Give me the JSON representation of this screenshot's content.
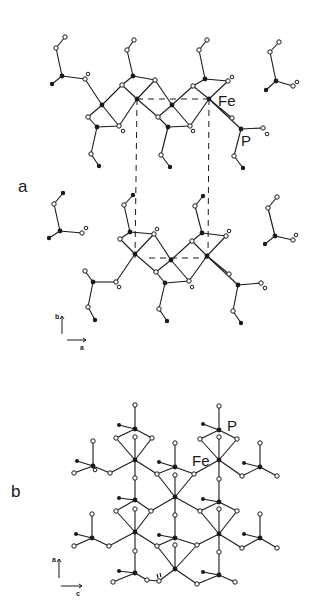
{
  "figure": {
    "panels": [
      {
        "id": "a",
        "label": "a",
        "atom_labels": {
          "fe": "Fe",
          "p": "P"
        },
        "axes": {
          "vertical": "b",
          "horizontal": "a"
        }
      },
      {
        "id": "b",
        "label": "b",
        "atom_labels": {
          "fe": "Fe",
          "p": "P"
        },
        "axes": {
          "vertical": "a",
          "horizontal": "c"
        }
      }
    ],
    "caption_fragment": "",
    "colors": {
      "ink": "#1a1a1a",
      "background": "#ffffff"
    }
  }
}
